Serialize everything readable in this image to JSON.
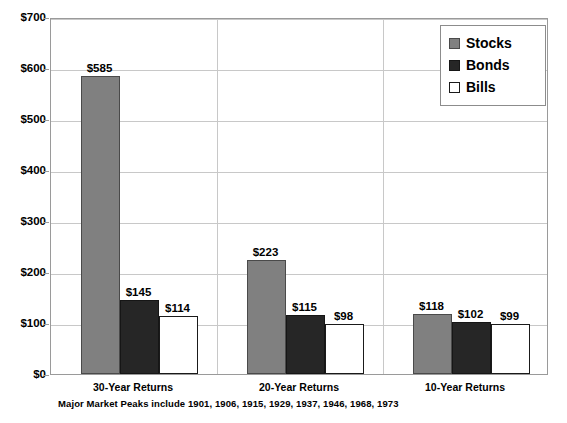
{
  "chart_data": {
    "type": "bar",
    "title": "",
    "subtitle": "",
    "xlabel": "",
    "ylabel": "",
    "ylim": [
      0,
      700
    ],
    "ytick_labels": [
      "$0",
      "$100",
      "$200",
      "$300",
      "$400",
      "$500",
      "$600",
      "$700"
    ],
    "ytick_values": [
      0,
      100,
      200,
      300,
      400,
      500,
      600,
      700
    ],
    "grid": true,
    "legend_position": "top-right",
    "categories": [
      "30-Year Returns",
      "20-Year Returns",
      "10-Year Returns"
    ],
    "series": [
      {
        "name": "Stocks",
        "color": "#808080",
        "values": [
          585,
          223,
          118
        ],
        "labels": [
          "$585",
          "$223",
          "$118"
        ]
      },
      {
        "name": "Bonds",
        "color": "#262626",
        "values": [
          145,
          115,
          102
        ],
        "labels": [
          "$145",
          "$115",
          "$102"
        ]
      },
      {
        "name": "Bills",
        "color": "#ffffff",
        "values": [
          114,
          98,
          99
        ],
        "labels": [
          "$114",
          "$98",
          "$99"
        ]
      }
    ],
    "annotations": [
      "Major Market Peaks include  1901, 1906, 1915, 1929, 1937, 1946, 1968, 1973"
    ]
  },
  "axis": {
    "y_ticks": [
      {
        "label": "$700",
        "value": 700
      },
      {
        "label": "$600",
        "value": 600
      },
      {
        "label": "$500",
        "value": 500
      },
      {
        "label": "$400",
        "value": 400
      },
      {
        "label": "$300",
        "value": 300
      },
      {
        "label": "$200",
        "value": 200
      },
      {
        "label": "$100",
        "value": 100
      },
      {
        "label": "$0",
        "value": 0
      }
    ]
  },
  "legend": {
    "items": [
      {
        "label": "Stocks",
        "color": "#808080"
      },
      {
        "label": "Bonds",
        "color": "#262626"
      },
      {
        "label": "Bills",
        "color": "#ffffff"
      }
    ]
  },
  "categories": [
    {
      "label": "30-Year Returns"
    },
    {
      "label": "20-Year Returns"
    },
    {
      "label": "10-Year Returns"
    }
  ],
  "bars": [
    {
      "label": "$585",
      "series": "Stocks",
      "category": "30-Year Returns"
    },
    {
      "label": "$145",
      "series": "Bonds",
      "category": "30-Year Returns"
    },
    {
      "label": "$114",
      "series": "Bills",
      "category": "30-Year Returns"
    },
    {
      "label": "$223",
      "series": "Stocks",
      "category": "20-Year Returns"
    },
    {
      "label": "$115",
      "series": "Bonds",
      "category": "20-Year Returns"
    },
    {
      "label": "$98",
      "series": "Bills",
      "category": "20-Year Returns"
    },
    {
      "label": "$118",
      "series": "Stocks",
      "category": "10-Year Returns"
    },
    {
      "label": "$102",
      "series": "Bonds",
      "category": "10-Year Returns"
    },
    {
      "label": "$99",
      "series": "Bills",
      "category": "10-Year Returns"
    }
  ],
  "footnote": {
    "text": "Major Market Peaks include  1901, 1906, 1915, 1929, 1937, 1946, 1968, 1973"
  }
}
